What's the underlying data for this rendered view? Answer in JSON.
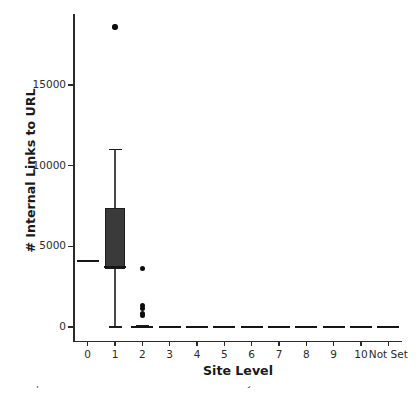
{
  "chart_data": {
    "type": "box",
    "title": "",
    "xlabel": "Site Level",
    "ylabel": "# Internal Links to URL",
    "grid": false,
    "legend": null,
    "ylim": [
      -900,
      19800
    ],
    "yticks": [
      0,
      5000,
      10000,
      15000
    ],
    "ytick_labels": [
      "0",
      "5000",
      "10000",
      "15000"
    ],
    "categories": [
      "0",
      "1",
      "2",
      "3",
      "4",
      "5",
      "6",
      "7",
      "8",
      "9",
      "10",
      "Not Set"
    ],
    "boxes": [
      {
        "category": "0",
        "q1": 4100,
        "median": 4100,
        "q3": 4100,
        "whisker_low": 4100,
        "whisker_high": 4100,
        "fliers": []
      },
      {
        "category": "1",
        "q1": 3600,
        "median": 3700,
        "q3": 7400,
        "whisker_low": 0,
        "whisker_high": 11000,
        "fliers": [
          18600
        ]
      },
      {
        "category": "2",
        "q1": 0,
        "median": 0,
        "q3": 40,
        "whisker_low": 0,
        "whisker_high": 90,
        "fliers": [
          3620,
          1320,
          1130,
          820,
          700
        ]
      },
      {
        "category": "3",
        "q1": 0,
        "median": 0,
        "q3": 20,
        "whisker_low": 0,
        "whisker_high": 40,
        "fliers": []
      },
      {
        "category": "4",
        "q1": 0,
        "median": 0,
        "q3": 20,
        "whisker_low": 0,
        "whisker_high": 40,
        "fliers": []
      },
      {
        "category": "5",
        "q1": 0,
        "median": 0,
        "q3": 20,
        "whisker_low": 0,
        "whisker_high": 40,
        "fliers": []
      },
      {
        "category": "6",
        "q1": 0,
        "median": 0,
        "q3": 20,
        "whisker_low": 0,
        "whisker_high": 40,
        "fliers": []
      },
      {
        "category": "7",
        "q1": 0,
        "median": 0,
        "q3": 20,
        "whisker_low": 0,
        "whisker_high": 40,
        "fliers": []
      },
      {
        "category": "8",
        "q1": 0,
        "median": 0,
        "q3": 20,
        "whisker_low": 0,
        "whisker_high": 40,
        "fliers": []
      },
      {
        "category": "9",
        "q1": 0,
        "median": 0,
        "q3": 20,
        "whisker_low": 0,
        "whisker_high": 40,
        "fliers": []
      },
      {
        "category": "10",
        "q1": 0,
        "median": 0,
        "q3": 0,
        "whisker_low": 0,
        "whisker_high": 0,
        "fliers": []
      },
      {
        "category": "Not Set",
        "q1": 0,
        "median": 0,
        "q3": 20,
        "whisker_low": 0,
        "whisker_high": 40,
        "fliers": []
      }
    ],
    "colors": {
      "box_fill": "#3a3a3a",
      "box_edge": "#1d1d1d",
      "whisker": "#4a4a4a",
      "flier": "#0d0d0d",
      "axis": "#2b2b2b",
      "text": "#1a1a1a",
      "background": "#ffffff"
    }
  },
  "caption": {
    "clipped_text": "Example distribution of internal links to a URL by site level"
  }
}
